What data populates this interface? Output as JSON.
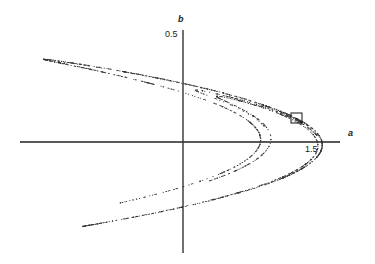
{
  "chart_data": {
    "type": "scatter",
    "title": "",
    "xlabel": "a",
    "ylabel": "b",
    "x_tick_labels": [
      "1.5"
    ],
    "y_tick_labels": [
      "0.5"
    ],
    "xlim": [
      -1.5,
      1.6
    ],
    "ylim": [
      -0.5,
      0.52
    ],
    "grid": false,
    "legend": null,
    "map_parameters": {
      "alpha": 1.4,
      "beta": 0.3
    },
    "sample_points": [
      [
        -1.28,
        0.38
      ],
      [
        -0.8,
        0.33
      ],
      [
        0,
        0.21
      ],
      [
        0.6,
        0.12
      ],
      [
        1.0,
        0.07
      ],
      [
        1.27,
        -0.01
      ],
      [
        1.1,
        -0.2
      ],
      [
        0.6,
        -0.27
      ],
      [
        0,
        -0.3
      ],
      [
        -0.6,
        -0.35
      ],
      [
        -1.0,
        -0.39
      ],
      [
        0.64,
        0.0
      ],
      [
        0.38,
        -0.2
      ],
      [
        -0.2,
        -0.25
      ],
      [
        -0.58,
        -0.29
      ]
    ],
    "annotations": [
      {
        "type": "box",
        "center": [
          1.06,
          0.05
        ],
        "note": "small square marking a region on the attractor"
      }
    ]
  },
  "axes": {
    "x_label": "a",
    "y_label": "b",
    "x_tick": "1.5",
    "y_tick": "0.5"
  }
}
